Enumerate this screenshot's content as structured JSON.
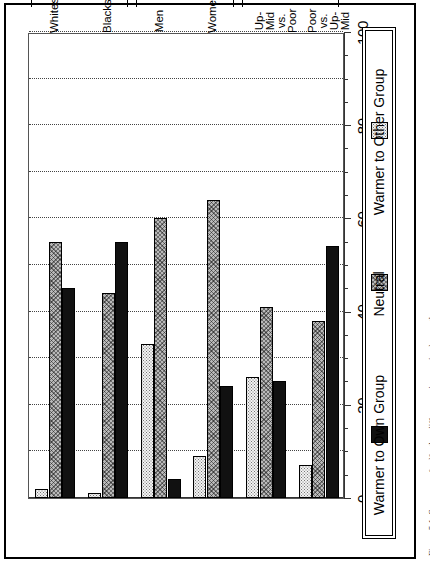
{
  "figure": {
    "caption": "Figure 5.1. Summary of self-other differences in perceived warmth"
  },
  "legend": {
    "position": "right",
    "items": [
      {
        "label": "Warmer to Own Group",
        "swatch": "solid-black-swatch",
        "color": "#111111"
      },
      {
        "label": "Neutral",
        "swatch": "hatched-gray-swatch",
        "color": "#b9b9b9"
      },
      {
        "label": "Warmer to Other Group",
        "swatch": "dotted-light-swatch",
        "color": "#f2f2f2"
      }
    ]
  },
  "axis": {
    "value_axis_title": "percentage",
    "tick_labels": [
      "0",
      "20",
      "40",
      "60",
      "80",
      "100"
    ],
    "tick_values": [
      0,
      20,
      40,
      60,
      80,
      100
    ],
    "minor_step": 5,
    "gridline_step": 10
  },
  "group_brackets": [
    {
      "label": "Race"
    },
    {
      "label": "Gender"
    },
    {
      "label": "Class"
    }
  ],
  "categories": [
    {
      "lines": [
        "Whites"
      ]
    },
    {
      "lines": [
        "Blacks"
      ]
    },
    {
      "lines": [
        "Men"
      ]
    },
    {
      "lines": [
        "Women"
      ]
    },
    {
      "lines": [
        "Up-Mid vs.",
        "Poor"
      ]
    },
    {
      "lines": [
        "Poor vs.",
        "Up-Mid"
      ]
    }
  ],
  "chart_data": {
    "type": "bar",
    "orientation": "horizontal",
    "title": "",
    "xlabel": "percentage",
    "ylabel": "",
    "xlim": [
      0,
      100
    ],
    "grid": true,
    "legend_position": "right",
    "categories": [
      "Whites",
      "Blacks",
      "Men",
      "Women",
      "Up-Mid vs. Poor",
      "Poor vs. Up-Mid"
    ],
    "category_groups": [
      "Race",
      "Race",
      "Gender",
      "Gender",
      "Class",
      "Class"
    ],
    "series": [
      {
        "name": "Warmer to Own Group",
        "values": [
          45,
          55,
          4,
          24,
          25,
          54
        ]
      },
      {
        "name": "Neutral",
        "values": [
          55,
          44,
          60,
          64,
          41,
          38
        ]
      },
      {
        "name": "Warmer to Other Group",
        "values": [
          2,
          1,
          33,
          9,
          26,
          7
        ]
      }
    ]
  }
}
